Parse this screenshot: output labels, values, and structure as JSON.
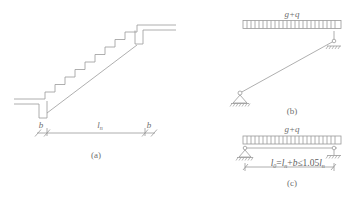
{
  "figure": {
    "type": "engineering-diagram",
    "line_color": "#9a9a9a",
    "text_color": "#6f6f6f",
    "background": "#ffffff"
  },
  "panel_a": {
    "caption": "(a)",
    "description": "stair flight longitudinal profile with landing slabs",
    "step_count": 8,
    "dimensions": [
      {
        "name": "support-width-left",
        "label": "b"
      },
      {
        "name": "clear-span",
        "label": "l",
        "subscript": "n"
      },
      {
        "name": "support-width-right",
        "label": "b"
      }
    ]
  },
  "panel_b": {
    "caption": "(b)",
    "description": "inclined simply supported beam model under uniform load",
    "load_label": "g+q",
    "supports": [
      {
        "name": "pin-support",
        "position": "bottom-left"
      },
      {
        "name": "roller-support",
        "position": "top-right"
      }
    ]
  },
  "panel_c": {
    "caption": "(c)",
    "description": "equivalent horizontal beam model with effective span",
    "load_label": "g+q",
    "formula": {
      "lhs": "l",
      "lhs_sub": "0",
      "eq": "=",
      "term1": "l",
      "term1_sub": "n",
      "plus": "+",
      "term2": "b",
      "le": "≤",
      "coef": "1.05",
      "term3": "l",
      "term3_sub": "n",
      "full_text": "l0 = ln + b ≤ 1.05 ln"
    },
    "supports": [
      {
        "name": "pin-support",
        "position": "left"
      },
      {
        "name": "roller-support",
        "position": "right"
      }
    ]
  }
}
